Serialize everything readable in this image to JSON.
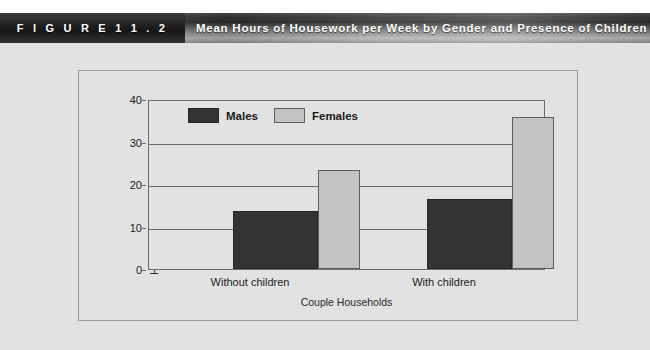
{
  "header": {
    "figure_tab_label": "F I G U R E   1 1 . 2",
    "title": "Mean Hours of Housework per Week by Gender and Presence of Children"
  },
  "colors": {
    "male_bar": "#333333",
    "female_bar": "#c2c2c2",
    "panel_background": "#e2e2e2",
    "axis_line": "#6d6d6d",
    "frame_border": "#9a9a9a"
  },
  "chart_data": {
    "type": "bar",
    "title": "Mean Hours of Housework per Week by Gender and Presence of Children",
    "categories": [
      "Without children",
      "With children"
    ],
    "series": [
      {
        "name": "Males",
        "values": [
          13.7,
          16.5
        ],
        "color": "#333333"
      },
      {
        "name": "Females",
        "values": [
          23.4,
          35.8
        ],
        "color": "#c2c2c2"
      }
    ],
    "xlabel": "Couple Households",
    "ylabel": "Hours per week",
    "ylim": [
      0,
      40
    ],
    "yticks": [
      0,
      10,
      20,
      30,
      40
    ],
    "ytick_labels": [
      "0",
      "10",
      "20",
      "30",
      "40"
    ],
    "grid": true,
    "legend_position": "top-left-inside"
  }
}
